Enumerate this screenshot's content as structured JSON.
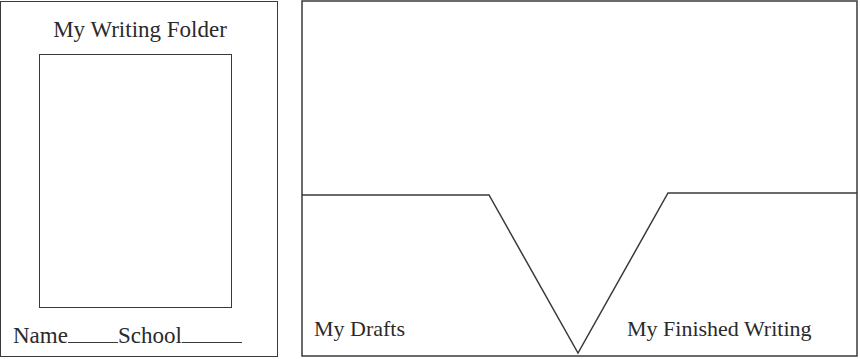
{
  "front_cover": {
    "title": "My Writing Folder",
    "name_label": "Name",
    "school_label": "School"
  },
  "inside": {
    "left_pocket_label": "My Drafts",
    "right_pocket_label": "My Finished Writing"
  },
  "colors": {
    "line": "#3a3a3a",
    "background": "#ffffff",
    "text": "#2a2a2a"
  }
}
